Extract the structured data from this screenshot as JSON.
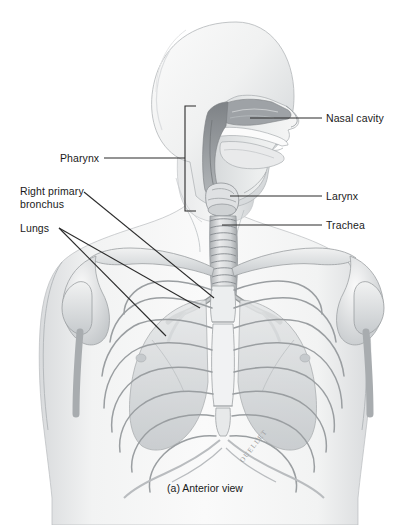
{
  "figure": {
    "caption": "(a) Anterior view",
    "signature": "OUELLET",
    "background": "#ffffff",
    "text_color": "#1a1a1a",
    "leader_color": "#2b2b2b"
  },
  "labels": {
    "nasal_cavity": "Nasal cavity",
    "larynx": "Larynx",
    "trachea": "Trachea",
    "pharynx": "Pharynx",
    "right_primary_bronchus_line1": "Right primary",
    "right_primary_bronchus_line2": "bronchus",
    "lungs": "Lungs"
  },
  "structures": [
    "skull",
    "head-profile",
    "nasal-cavity",
    "hard-palate",
    "soft-palate",
    "tongue",
    "pharynx",
    "larynx",
    "trachea",
    "right-primary-bronchus",
    "left-primary-bronchus",
    "lungs",
    "rib-cage",
    "sternum",
    "clavicle",
    "scapula",
    "humerus",
    "diaphragm-margin",
    "torso-silhouette"
  ],
  "palette": {
    "outline": "#6e7175",
    "bone_light": "#eceded",
    "bone_mid": "#cfd2d4",
    "bone_dark": "#a9adb0",
    "tissue_light": "#f3f4f4",
    "tissue_mid": "#d8dadc",
    "tissue_dark": "#9fa3a7",
    "cavity_dark": "#8d9195",
    "skin": "#f0f1f1"
  }
}
